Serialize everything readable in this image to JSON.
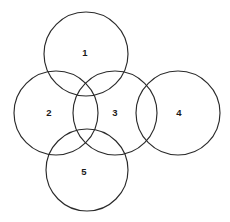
{
  "diagram": {
    "type": "venn-diagram",
    "canvas": {
      "width": 230,
      "height": 222
    },
    "background_color": "#ffffff",
    "stroke_color": "#2a2a2a",
    "stroke_width": 1.15,
    "label_color": "#1a1a1a",
    "circles": [
      {
        "label": "1",
        "cx": 86,
        "cy": 54,
        "r": 42,
        "label_x": 85,
        "label_y": 53,
        "name": "circle-1-top"
      },
      {
        "label": "2",
        "cx": 56,
        "cy": 113,
        "r": 42,
        "label_x": 49,
        "label_y": 113,
        "name": "circle-2-left"
      },
      {
        "label": "3",
        "cx": 115,
        "cy": 113,
        "r": 42,
        "label_x": 115,
        "label_y": 113,
        "name": "circle-3-center"
      },
      {
        "label": "4",
        "cx": 178,
        "cy": 113,
        "r": 42,
        "label_x": 179,
        "label_y": 113,
        "name": "circle-4-right"
      },
      {
        "label": "5",
        "cx": 87,
        "cy": 170,
        "r": 41,
        "label_x": 84,
        "label_y": 172,
        "name": "circle-5-bottom"
      }
    ]
  }
}
